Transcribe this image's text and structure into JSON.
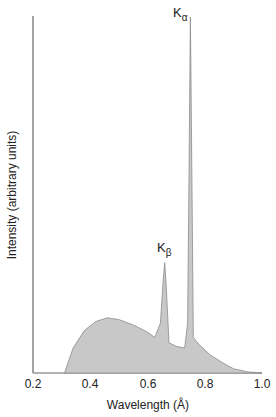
{
  "chart_data": {
    "type": "area",
    "title": "",
    "xlabel": "Wavelength (Å)",
    "ylabel": "Intensity (arbitrary units)",
    "x_ticks": [
      "0.2",
      "0.4",
      "0.6",
      "0.8",
      "1.0"
    ],
    "xlim": [
      0.2,
      1.0
    ],
    "ylim": [
      0,
      1
    ],
    "grid": false,
    "legend": null,
    "annotations": [
      {
        "label": "K",
        "sub": "β",
        "x": 0.66,
        "y": 0.31
      },
      {
        "label": "K",
        "sub": "α",
        "x": 0.75,
        "y": 1.0
      }
    ],
    "series": [
      {
        "name": "X-ray emission spectrum",
        "x": [
          0.31,
          0.34,
          0.38,
          0.42,
          0.46,
          0.5,
          0.55,
          0.6,
          0.625,
          0.645,
          0.655,
          0.66,
          0.665,
          0.675,
          0.7,
          0.73,
          0.74,
          0.745,
          0.75,
          0.755,
          0.76,
          0.78,
          0.82,
          0.86,
          0.9,
          0.95,
          1.0
        ],
        "values": [
          0.0,
          0.07,
          0.12,
          0.145,
          0.155,
          0.15,
          0.135,
          0.115,
          0.1,
          0.14,
          0.26,
          0.31,
          0.25,
          0.085,
          0.075,
          0.07,
          0.14,
          0.55,
          1.0,
          0.55,
          0.1,
          0.08,
          0.05,
          0.03,
          0.012,
          0.003,
          0.0
        ]
      }
    ]
  },
  "labels": {
    "x_ticks": [
      "0.2",
      "0.4",
      "0.6",
      "0.8",
      "1.0"
    ],
    "xlabel": "Wavelength (Å)",
    "ylabel": "Intensity (arbitrary units)",
    "k_alpha": {
      "main": "K",
      "sub": "α"
    },
    "k_beta": {
      "main": "K",
      "sub": "β"
    }
  },
  "colors": {
    "fill": "#c8c8c8",
    "stroke": "#8a8a8a",
    "axis": "#555555"
  }
}
